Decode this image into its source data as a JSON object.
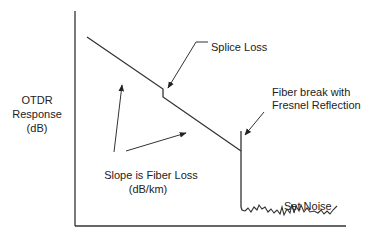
{
  "diagram": {
    "type": "OTDR trace schematic",
    "y_axis_label": {
      "line1": "OTDR",
      "line2": "Response",
      "line3": "(dB)"
    },
    "annotations": {
      "splice": "Splice Loss",
      "break_line1": "Fiber break with",
      "break_line2": "Fresnel Reflection",
      "slope_line1": "Slope is Fiber Loss",
      "slope_line2": "(dB/km)",
      "noise": "Set Noise"
    },
    "colors": {
      "line": "#333333",
      "text": "#222222",
      "background": "#ffffff"
    }
  }
}
